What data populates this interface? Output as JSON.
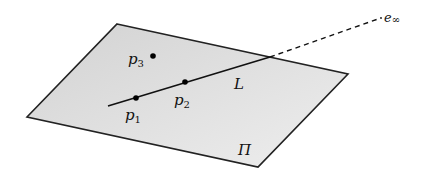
{
  "diagram": {
    "plane": {
      "label": "Π",
      "fill": "#dcdcdc",
      "stroke": "#222222",
      "corners": [
        [
          117,
          24
        ],
        [
          348,
          74
        ],
        [
          258,
          167
        ],
        [
          27,
          117
        ]
      ]
    },
    "line": {
      "label": "L",
      "solid_start": [
        108,
        106
      ],
      "solid_end": [
        270,
        57
      ],
      "dashed_end": [
        378,
        19
      ]
    },
    "points": [
      {
        "name": "p",
        "sub": "1",
        "x": 136,
        "y": 98
      },
      {
        "name": "p",
        "sub": "2",
        "x": 185,
        "y": 82
      },
      {
        "name": "p",
        "sub": "3",
        "x": 153,
        "y": 56
      }
    ],
    "infinity_point": {
      "name": "e",
      "sub": "∞"
    }
  }
}
